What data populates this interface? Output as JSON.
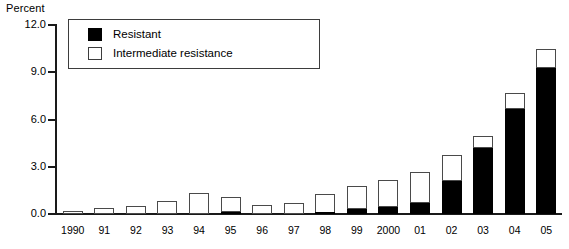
{
  "chart_data": {
    "type": "bar",
    "stacked": true,
    "title": "",
    "subtitle": "",
    "xlabel": "",
    "ylabel": "Percent",
    "ylim": [
      0.0,
      12.0
    ],
    "ytick_labels": [
      "0.0",
      "3.0",
      "6.0",
      "9.0",
      "12.0"
    ],
    "ytick_values": [
      0.0,
      3.0,
      6.0,
      9.0,
      12.0
    ],
    "grid": false,
    "legend_position": "top-left",
    "categories": [
      "1990",
      "91",
      "92",
      "93",
      "94",
      "95",
      "96",
      "97",
      "98",
      "99",
      "2000",
      "01",
      "02",
      "03",
      "04",
      "05"
    ],
    "series": [
      {
        "name": "Resistant",
        "color": "#000000",
        "values": [
          0.0,
          0.0,
          0.0,
          0.0,
          0.0,
          0.15,
          0.0,
          0.0,
          0.05,
          0.35,
          0.45,
          0.7,
          2.1,
          4.2,
          6.65,
          9.25
        ]
      },
      {
        "name": "Intermediate resistance",
        "color": "#ffffff",
        "values": [
          0.2,
          0.4,
          0.5,
          0.8,
          1.35,
          0.95,
          0.6,
          0.7,
          1.25,
          1.4,
          1.7,
          1.95,
          1.65,
          0.75,
          1.05,
          1.25
        ]
      }
    ],
    "totals": [
      0.2,
      0.4,
      0.5,
      0.8,
      1.35,
      1.1,
      0.6,
      0.7,
      1.3,
      1.75,
      2.15,
      2.65,
      3.75,
      4.95,
      7.7,
      10.5
    ]
  },
  "legend": {
    "items": [
      {
        "label": "Resistant",
        "swatch": "filled-square-icon"
      },
      {
        "label": "Intermediate resistance",
        "swatch": "hollow-square-icon"
      }
    ]
  }
}
